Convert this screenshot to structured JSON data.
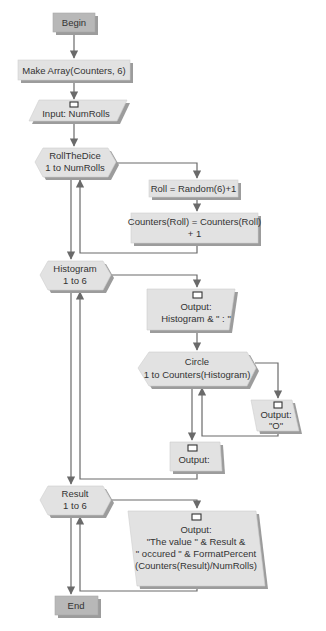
{
  "diagram": {
    "type": "flowchart",
    "colors": {
      "terminal_fill": "#b8b8b8",
      "shape_fill": "#e2e2e2",
      "shadow": "#9c9c9c",
      "connector": "#6a6a6a",
      "text": "#333333"
    },
    "nodes": {
      "begin": {
        "shape": "terminal",
        "lines": [
          "Begin"
        ]
      },
      "make_array": {
        "shape": "process",
        "lines": [
          "Make Array(Counters, 6)"
        ]
      },
      "input_numrolls": {
        "shape": "input",
        "icon": "screen-icon",
        "lines": [
          "Input: NumRolls"
        ]
      },
      "loop_rollthedice": {
        "shape": "loop",
        "lines": [
          "RollTheDice",
          "1 to NumRolls"
        ]
      },
      "assign_roll": {
        "shape": "process",
        "lines": [
          "Roll = Random(6)+1"
        ]
      },
      "increment_counter": {
        "shape": "process",
        "lines": [
          "Counters(Roll) = Counters(Roll)",
          "+ 1"
        ]
      },
      "loop_histogram": {
        "shape": "loop",
        "lines": [
          "Histogram",
          "1 to 6"
        ]
      },
      "output_histogram": {
        "shape": "output",
        "icon": "screen-icon",
        "lines": [
          "Output:",
          "Histogram & \" : \""
        ]
      },
      "loop_circle": {
        "shape": "loop",
        "lines": [
          "Circle",
          "1 to Counters(Histogram)"
        ]
      },
      "output_o": {
        "shape": "output",
        "icon": "screen-icon",
        "lines": [
          "Output:",
          "\"O\""
        ]
      },
      "output_newline": {
        "shape": "output",
        "icon": "screen-icon",
        "lines": [
          "Output:"
        ]
      },
      "loop_result": {
        "shape": "loop",
        "lines": [
          "Result",
          "1 to 6"
        ]
      },
      "output_result": {
        "shape": "output",
        "icon": "screen-icon",
        "lines": [
          "Output:",
          "\"The value \" & Result &",
          "\" occured \" & FormatPercent",
          "(Counters(Result)/NumRolls)"
        ]
      },
      "end": {
        "shape": "terminal",
        "lines": [
          "End"
        ]
      }
    },
    "edges": [
      [
        "begin",
        "make_array"
      ],
      [
        "make_array",
        "input_numrolls"
      ],
      [
        "input_numrolls",
        "loop_rollthedice"
      ],
      [
        "loop_rollthedice",
        "assign_roll"
      ],
      [
        "assign_roll",
        "increment_counter"
      ],
      [
        "increment_counter",
        "loop_rollthedice"
      ],
      [
        "loop_rollthedice",
        "loop_histogram"
      ],
      [
        "loop_histogram",
        "output_histogram"
      ],
      [
        "output_histogram",
        "loop_circle"
      ],
      [
        "loop_circle",
        "output_o"
      ],
      [
        "output_o",
        "loop_circle"
      ],
      [
        "loop_circle",
        "output_newline"
      ],
      [
        "output_newline",
        "loop_histogram"
      ],
      [
        "loop_histogram",
        "loop_result"
      ],
      [
        "loop_result",
        "output_result"
      ],
      [
        "output_result",
        "loop_result"
      ],
      [
        "loop_result",
        "end"
      ]
    ]
  }
}
